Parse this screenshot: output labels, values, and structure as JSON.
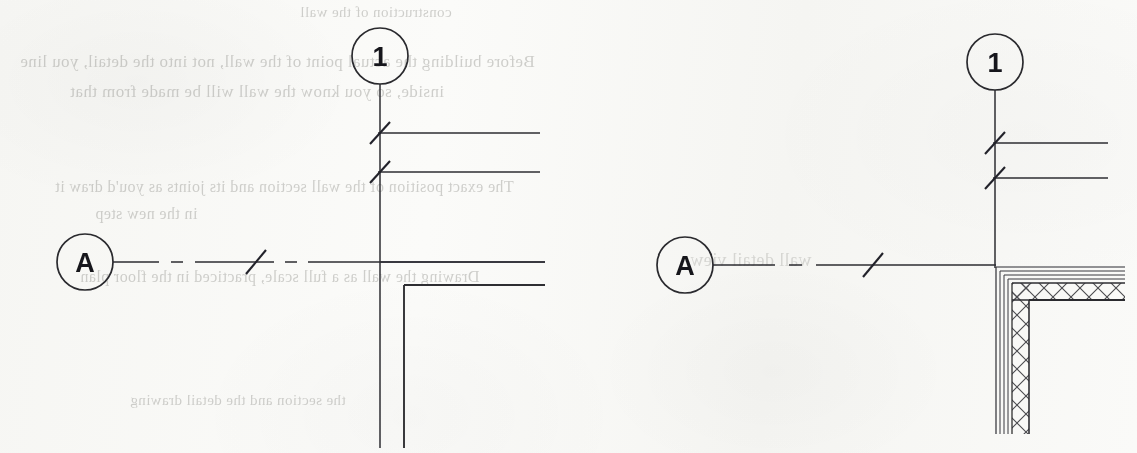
{
  "document": {
    "kind": "scanned-architectural-drawing",
    "page_background": "#f8f8f6",
    "ink_color": "#2a2a2e",
    "width": 1137,
    "height": 453
  },
  "bleed_through_text": {
    "note": "Faint mirrored text showing through from the reverse side of the scanned page",
    "color": "#8d8d88",
    "lines": [
      {
        "id": "bleed-0",
        "text": "construction of the wall",
        "x": 300,
        "y": 4,
        "size": 15
      },
      {
        "id": "bleed-1",
        "text": "Before building the actual point of the wall, not into the detail, you line",
        "x": 20,
        "y": 52,
        "size": 17
      },
      {
        "id": "bleed-2",
        "text": "inside, so you know the wall will be made from that",
        "x": 70,
        "y": 82,
        "size": 17
      },
      {
        "id": "bleed-3",
        "text": "The exact position of the wall section and its joints as you'd draw it",
        "x": 55,
        "y": 178,
        "size": 16
      },
      {
        "id": "bleed-4",
        "text": "in the new step",
        "x": 95,
        "y": 205,
        "size": 16
      },
      {
        "id": "bleed-5",
        "text": "Drawing the wall as a full scale, practiced in the floor plan",
        "x": 80,
        "y": 268,
        "size": 16
      },
      {
        "id": "bleed-6",
        "text": "the section and the detail drawing",
        "x": 130,
        "y": 392,
        "size": 15
      },
      {
        "id": "bleed-7",
        "text": "wall detail view",
        "x": 690,
        "y": 250,
        "size": 18
      }
    ]
  },
  "details": [
    {
      "id": "detail-left",
      "name": "simple-wall-corner-detail",
      "grid_bubbles": [
        {
          "id": "left-bubble-1",
          "label": "1",
          "axis": "vertical",
          "cx": 380,
          "cy": 56,
          "r": 28
        },
        {
          "id": "left-bubble-a",
          "label": "A",
          "axis": "horizontal",
          "cx": 85,
          "cy": 262,
          "r": 28
        }
      ],
      "grid_lines": [
        {
          "id": "left-gridline-1",
          "axis": "vertical",
          "x": 380,
          "y1": 84,
          "y2": 448,
          "style": "solid-thin"
        },
        {
          "id": "left-gridline-a",
          "axis": "horizontal",
          "y": 262,
          "x1": 113,
          "x2": 545,
          "style": "dash-dot"
        }
      ],
      "grid_tick_marks": [
        {
          "id": "left-tick-dim-1",
          "x": 380,
          "y": 133
        },
        {
          "id": "left-tick-dim-2",
          "x": 380,
          "y": 172
        },
        {
          "id": "left-tick-grid-a",
          "x": 255,
          "y": 262
        }
      ],
      "dimension_lines": [
        {
          "id": "left-dim-line-1",
          "y": 133,
          "x1": 378,
          "x2": 540
        },
        {
          "id": "left-dim-line-2",
          "y": 172,
          "x1": 378,
          "x2": 540
        }
      ],
      "wall_lines": [
        {
          "id": "left-wall-outer-vertical",
          "x": 380,
          "y1": 84,
          "y2": 448
        },
        {
          "id": "left-wall-inner-vertical",
          "x": 404,
          "y1": 285,
          "y2": 448
        },
        {
          "id": "left-wall-inner-horizontal",
          "y": 285,
          "x1": 404,
          "x2": 545
        },
        {
          "id": "left-wall-outer-horizontal",
          "y": 262,
          "x1": 380,
          "x2": 545
        }
      ]
    },
    {
      "id": "detail-right",
      "name": "hatched-wall-assembly-detail",
      "grid_bubbles": [
        {
          "id": "right-bubble-1",
          "label": "1",
          "axis": "vertical",
          "cx": 995,
          "cy": 62,
          "r": 28
        },
        {
          "id": "right-bubble-a",
          "label": "A",
          "axis": "horizontal",
          "cx": 685,
          "cy": 265,
          "r": 28
        }
      ],
      "grid_lines": [
        {
          "id": "right-gridline-1",
          "axis": "vertical",
          "x": 995,
          "y1": 90,
          "y2": 268,
          "style": "solid-thin"
        },
        {
          "id": "right-gridline-a",
          "axis": "horizontal",
          "y": 265,
          "x1": 713,
          "x2": 1000,
          "style": "dash-dot"
        }
      ],
      "grid_tick_marks": [
        {
          "id": "right-tick-dim-1",
          "x": 995,
          "y": 143
        },
        {
          "id": "right-tick-dim-2",
          "x": 995,
          "y": 178
        },
        {
          "id": "right-tick-grid-a",
          "x": 872,
          "y": 265
        }
      ],
      "dimension_lines": [
        {
          "id": "right-dim-line-1",
          "y": 143,
          "x1": 993,
          "x2": 1108
        },
        {
          "id": "right-dim-line-2",
          "y": 178,
          "x1": 993,
          "x2": 1108
        }
      ],
      "wall_assembly": {
        "id": "right-wall-assembly",
        "corner_x": 995,
        "corner_y": 266,
        "extends_right_to": 1125,
        "extends_down_to": 435,
        "layers": [
          {
            "id": "layer-finish-outer",
            "name": "outer finish skin",
            "offset": 1,
            "thickness": 2,
            "fill": "none"
          },
          {
            "id": "layer-sheathing",
            "name": "sheathing",
            "offset": 4,
            "thickness": 3,
            "fill": "none"
          },
          {
            "id": "layer-cavity",
            "name": "cavity / air gap",
            "offset": 8,
            "thickness": 3,
            "fill": "none"
          },
          {
            "id": "layer-insulation",
            "name": "insulation core",
            "offset": 12,
            "thickness": 17,
            "fill": "cross-hatch"
          },
          {
            "id": "layer-structure",
            "name": "structural line",
            "offset": 29,
            "thickness": 2,
            "fill": "none"
          }
        ],
        "hatch_pattern": "x-cross"
      }
    }
  ]
}
